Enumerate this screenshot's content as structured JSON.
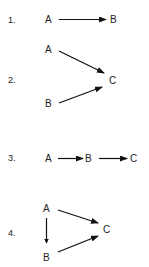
{
  "diagrams": [
    {
      "number": "1.",
      "nodes": [
        {
          "id": "A",
          "label": "A"
        },
        {
          "id": "B",
          "label": "B"
        }
      ],
      "edges": [
        {
          "from": "A",
          "to": "B"
        }
      ]
    },
    {
      "number": "2.",
      "nodes": [
        {
          "id": "A",
          "label": "A"
        },
        {
          "id": "B",
          "label": "B"
        },
        {
          "id": "C",
          "label": "C"
        }
      ],
      "edges": [
        {
          "from": "A",
          "to": "C"
        },
        {
          "from": "B",
          "to": "C"
        }
      ]
    },
    {
      "number": "3.",
      "nodes": [
        {
          "id": "A",
          "label": "A"
        },
        {
          "id": "B",
          "label": "B"
        },
        {
          "id": "C",
          "label": "C"
        }
      ],
      "edges": [
        {
          "from": "A",
          "to": "B"
        },
        {
          "from": "B",
          "to": "C"
        }
      ]
    },
    {
      "number": "4.",
      "nodes": [
        {
          "id": "A",
          "label": "A"
        },
        {
          "id": "B",
          "label": "B"
        },
        {
          "id": "C",
          "label": "C"
        }
      ],
      "edges": [
        {
          "from": "A",
          "to": "C"
        },
        {
          "from": "A",
          "to": "B"
        },
        {
          "from": "B",
          "to": "C"
        }
      ]
    }
  ]
}
